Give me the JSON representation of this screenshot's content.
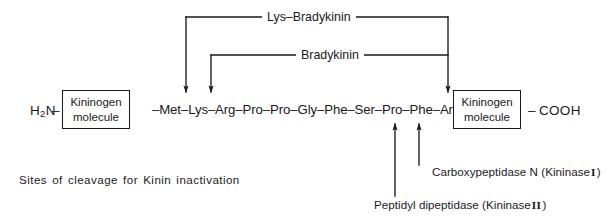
{
  "figure": {
    "caption_note": "Sites of cleavage for Kinin inactivation"
  },
  "backbone": {
    "n_terminus": "H",
    "n_terminus_sub": "2",
    "n_terminus_tail": "N",
    "dash_left": "–",
    "left_box": {
      "line1": "Kininogen",
      "line2": "molecule"
    },
    "peptide_sequence": "–Met–Lys–Arg–Pro–Pro–Gly–Phe–Ser–Pro–Phe–Arg–",
    "right_box": {
      "line1": "Kininogen",
      "line2": "molecule"
    },
    "dash_right": "–",
    "c_terminus": "COOH"
  },
  "brackets": [
    {
      "label": "Lys–Bradykinin",
      "x_left": 186,
      "x_right": 448,
      "y_top": 17
    },
    {
      "label": "Bradykinin",
      "x_left": 211,
      "x_right": 448,
      "y_top": 55
    }
  ],
  "cleavage_arrows": [
    {
      "name": "lys-bradykinin-n-terminal-cleavage",
      "direction": "down",
      "x": 186
    },
    {
      "name": "bradykinin-n-terminal-cleavage",
      "direction": "down",
      "x": 211
    },
    {
      "name": "kinin-c-terminal-cleavage",
      "direction": "down",
      "x": 448
    },
    {
      "name": "peptidyl-dipeptidase-cleavage",
      "direction": "up",
      "x": 395
    },
    {
      "name": "carboxypeptidase-cleavage",
      "direction": "up",
      "x": 419
    }
  ],
  "enzymes": [
    {
      "name": "Carboxypeptidase N",
      "kininase_open": "(Kininase",
      "kininase_numeral": "I",
      "kininase_close": ")"
    },
    {
      "name": "Peptidyl dipeptidase",
      "kininase_open": "(Kininase",
      "kininase_numeral": "II",
      "kininase_close": ")"
    }
  ],
  "colors": {
    "ink": "#1a1a1a",
    "background": "#ffffff"
  }
}
